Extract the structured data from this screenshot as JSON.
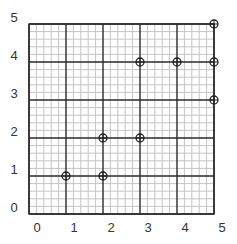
{
  "chart_data": {
    "type": "scatter",
    "title": "",
    "xlabel": "",
    "ylabel": "",
    "xlim": [
      0,
      5
    ],
    "ylim": [
      0,
      5
    ],
    "x_ticks": [
      "0",
      "1",
      "2",
      "3",
      "4",
      "5"
    ],
    "y_ticks": [
      "0",
      "1",
      "2",
      "3",
      "4",
      "5"
    ],
    "grid": true,
    "minor_grid_subdivisions": 5,
    "marker": "circle-with-cross",
    "series": [
      {
        "name": "points",
        "points": [
          {
            "x": 1,
            "y": 1
          },
          {
            "x": 2,
            "y": 1
          },
          {
            "x": 2,
            "y": 2
          },
          {
            "x": 3,
            "y": 2
          },
          {
            "x": 3,
            "y": 4
          },
          {
            "x": 4,
            "y": 4
          },
          {
            "x": 5,
            "y": 4
          },
          {
            "x": 5,
            "y": 3
          },
          {
            "x": 5,
            "y": 5
          }
        ]
      }
    ],
    "colors": {
      "major_grid": "#2a2a2a",
      "minor_grid": "#c4c4c4",
      "marker": "#222222",
      "text": "#333333"
    }
  }
}
